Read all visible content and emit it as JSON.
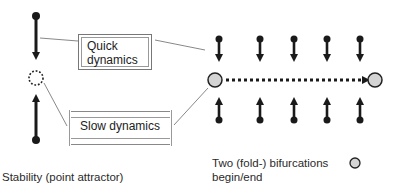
{
  "diagram": {
    "boxes": {
      "quick": "Quick dynamics",
      "quick_line1": "Quick",
      "quick_line2": "dynamics",
      "slow": "Slow dynamics"
    },
    "legend": {
      "stability": "Stability (point attractor)",
      "bifurcation_line1": "Two (fold-) bifurcations",
      "bifurcation_line2": "begin/end",
      "bifurcation_symbol": "grey-circle"
    },
    "colors": {
      "arrow": "#1a1a1a",
      "bifurcation_fill": "#d4d4d4",
      "box_border": "#888888",
      "connector": "#666666"
    },
    "left_column": {
      "top_point": "filled-dot",
      "middle_point": "dotted-circle (attractor)",
      "bottom_point": "filled-dot"
    },
    "right_panel": {
      "arrow_columns": 5,
      "start_node": "bifurcation circle",
      "end_node": "bifurcation circle",
      "trajectory": "dotted arrow"
    }
  }
}
